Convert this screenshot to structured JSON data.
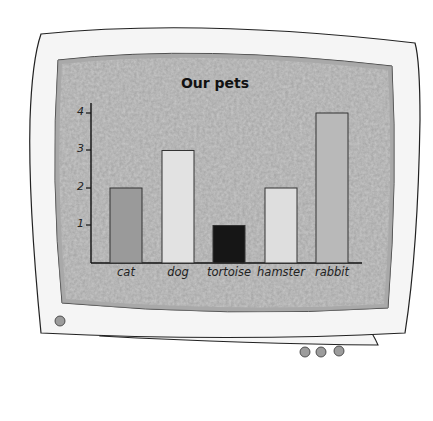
{
  "chart_data": {
    "type": "bar",
    "title": "Our pets",
    "xlabel": "",
    "ylabel": "",
    "categories": [
      "cat",
      "dog",
      "tortoise",
      "hamster",
      "rabbit"
    ],
    "values": [
      2,
      3,
      1,
      2,
      4
    ],
    "bar_colors": [
      "#9a9a9a",
      "#e2e2e2",
      "#161616",
      "#dedede",
      "#b9b9b9"
    ],
    "yticks": [
      "1",
      "2",
      "3",
      "4"
    ],
    "ylim": [
      0,
      4.3
    ],
    "grid": false,
    "legend": null
  },
  "frame": {
    "screen_color": "#a8a8a8",
    "bezel_color": "#f4f4f4",
    "button_color": "#9c9c9c"
  }
}
